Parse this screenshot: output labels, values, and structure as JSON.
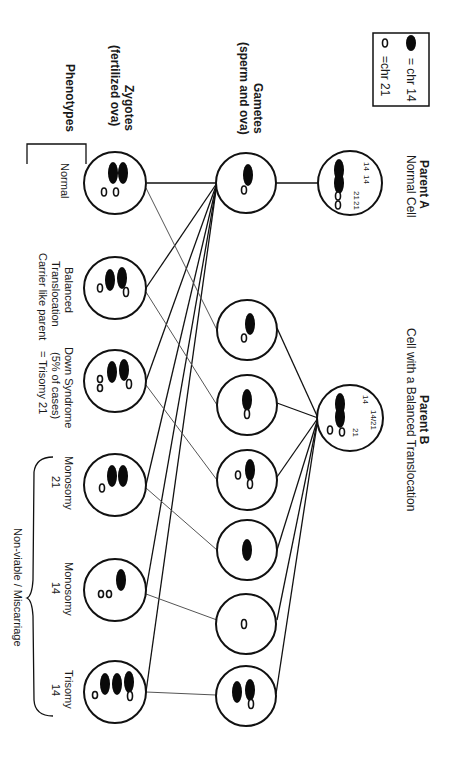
{
  "legend": {
    "items": [
      {
        "symbol": "filled-ellipse",
        "label": "= chr 14"
      },
      {
        "symbol": "hollow-ellipse",
        "label": "=chr 21"
      }
    ]
  },
  "parent_a": {
    "title": "Parent A",
    "subtitle": "Normal Cell",
    "chromosome_labels": [
      "14",
      "14",
      "21",
      "21"
    ]
  },
  "parent_b": {
    "title": "Parent B",
    "subtitle": "Cell with a Balanced Translocation",
    "chromosome_labels": [
      "14",
      "14/21",
      "21"
    ]
  },
  "row_labels": {
    "gametes_title": "Gametes",
    "gametes_sub": "(sperm and ova)",
    "zygotes_title": "Zygotes",
    "zygotes_sub": "(fertilized ova)",
    "phenotypes_title": "Phenotypes"
  },
  "gametes_a": [
    {
      "contents": [
        "chr14",
        "chr21"
      ]
    }
  ],
  "gametes_b": [
    {
      "contents": [
        "chr14",
        "chr21"
      ]
    },
    {
      "contents": [
        "t14/21"
      ]
    },
    {
      "contents": [
        "t14/21",
        "chr21"
      ]
    },
    {
      "contents": [
        "chr14"
      ]
    },
    {
      "contents": [
        "chr21"
      ]
    },
    {
      "contents": [
        "t14/21",
        "chr14"
      ]
    }
  ],
  "zygotes": [
    {
      "contents": [
        "chr14",
        "chr14",
        "chr21",
        "chr21"
      ],
      "phenotype": [
        "Normal"
      ]
    },
    {
      "contents": [
        "t14/21",
        "chr14",
        "chr21"
      ],
      "phenotype": [
        "Balanced",
        "Translocation",
        "Carrier like parent"
      ]
    },
    {
      "contents": [
        "t14/21",
        "chr14",
        "chr21",
        "chr21"
      ],
      "phenotype": [
        "Down Syndrome",
        "(5% of cases)",
        "= Trisomy 21"
      ]
    },
    {
      "contents": [
        "chr14",
        "chr14",
        "chr21"
      ],
      "phenotype": [
        "Monosomy",
        "21"
      ]
    },
    {
      "contents": [
        "chr14",
        "chr21",
        "chr21"
      ],
      "phenotype": [
        "Monosomy",
        "14"
      ]
    },
    {
      "contents": [
        "t14/21",
        "chr14",
        "chr14",
        "chr21"
      ],
      "phenotype": [
        "Trisomy",
        "14"
      ]
    }
  ],
  "group_label": "Non-viable / Miscarriage",
  "colors": {
    "line": "#111111",
    "fill": "#0a0a0a",
    "background": "#ffffff"
  }
}
